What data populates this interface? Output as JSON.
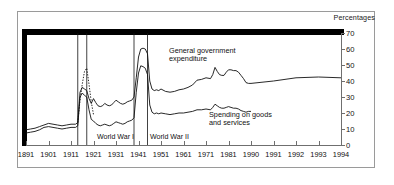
{
  "chart_data": {
    "type": "line",
    "title": "",
    "subtitle": "",
    "xlabel": "",
    "ylabel": "Percentages",
    "ylim": [
      0,
      70
    ],
    "ytick_labels": [
      "0",
      "10",
      "20",
      "30",
      "40",
      "50",
      "60",
      "70"
    ],
    "ytick_values": [
      0,
      10,
      20,
      30,
      40,
      50,
      60,
      70
    ],
    "xtick_labels": [
      "1891",
      "1901",
      "1911",
      "1921",
      "1931",
      "1941",
      "1951",
      "1961",
      "1971",
      "1981",
      "1990",
      "1991",
      "1992",
      "1993",
      "1994"
    ],
    "grid": false,
    "legend_position": "inline-annotations",
    "annotations": [
      {
        "name": "general-government-expenditure-label",
        "text_line1": "General government",
        "text_line2": "expenditure"
      },
      {
        "name": "spending-on-goods-and-services-label",
        "text_line1": "Spending on goods",
        "text_line2": "and services"
      },
      {
        "name": "world-war-1-label",
        "text": "World War I"
      },
      {
        "name": "world-war-2-label",
        "text": "World War II"
      }
    ],
    "event_markers": [
      {
        "label": "World War I",
        "start_year": 1914,
        "end_year": 1918
      },
      {
        "label": "World War II",
        "start_year": 1939,
        "end_year": 1945
      }
    ],
    "series": [
      {
        "name": "General government expenditure",
        "style": "solid",
        "x": [
          1891,
          1893,
          1895,
          1897,
          1899,
          1901,
          1903,
          1905,
          1907,
          1909,
          1911,
          1913,
          1914,
          1915,
          1916,
          1917,
          1918,
          1919,
          1920,
          1921,
          1922,
          1923,
          1924,
          1925,
          1926,
          1927,
          1928,
          1929,
          1930,
          1931,
          1932,
          1933,
          1934,
          1935,
          1936,
          1937,
          1938,
          1939,
          1940,
          1941,
          1942,
          1943,
          1944,
          1945,
          1946,
          1947,
          1948,
          1949,
          1950,
          1951,
          1953,
          1955,
          1957,
          1959,
          1961,
          1963,
          1965,
          1967,
          1969,
          1971,
          1973,
          1974,
          1975,
          1976,
          1977,
          1978,
          1979,
          1980,
          1981,
          1982,
          1983,
          1984,
          1985,
          1986,
          1987,
          1988,
          1989,
          1990,
          1991,
          1992,
          1993,
          1994
        ],
        "values": [
          9.5,
          10.0,
          10.5,
          11.5,
          12.5,
          13.5,
          13.0,
          12.5,
          12.0,
          12.5,
          13.0,
          13.0,
          14.0,
          33.0,
          36.0,
          35.0,
          34.0,
          29.0,
          26.0,
          29.0,
          26.5,
          24.5,
          24.0,
          24.5,
          26.0,
          25.0,
          24.5,
          25.0,
          26.5,
          28.0,
          27.0,
          26.0,
          25.5,
          26.0,
          27.0,
          27.5,
          28.0,
          30.0,
          42.0,
          55.0,
          60.0,
          60.5,
          60.0,
          57.0,
          40.0,
          35.0,
          34.0,
          34.5,
          34.0,
          35.0,
          33.5,
          33.0,
          33.5,
          34.5,
          35.0,
          36.0,
          37.5,
          40.5,
          41.0,
          42.0,
          41.5,
          44.0,
          48.5,
          46.0,
          44.0,
          43.5,
          43.5,
          45.5,
          47.0,
          47.0,
          46.5,
          46.5,
          45.5,
          43.5,
          41.5,
          39.0,
          38.5,
          38.5,
          40.0,
          42.0,
          42.5,
          42.0
        ]
      },
      {
        "name": "General government expenditure (dotted, war-years estimate)",
        "style": "dotted",
        "x": [
          1914,
          1915,
          1916,
          1917,
          1918,
          1919,
          1920,
          1921
        ],
        "values": [
          14.0,
          28.0,
          38.0,
          46.0,
          48.0,
          38.0,
          27.0,
          19.0
        ]
      },
      {
        "name": "Spending on goods and services",
        "style": "solid",
        "x": [
          1891,
          1893,
          1895,
          1897,
          1899,
          1901,
          1903,
          1905,
          1907,
          1909,
          1911,
          1913,
          1914,
          1915,
          1916,
          1917,
          1918,
          1919,
          1920,
          1921,
          1922,
          1923,
          1924,
          1925,
          1926,
          1927,
          1928,
          1929,
          1930,
          1931,
          1932,
          1933,
          1934,
          1935,
          1936,
          1937,
          1938,
          1939,
          1940,
          1941,
          1942,
          1943,
          1944,
          1945,
          1946,
          1947,
          1948,
          1949,
          1950,
          1951,
          1953,
          1955,
          1957,
          1959,
          1961,
          1963,
          1965,
          1967,
          1969,
          1971,
          1973,
          1974,
          1975,
          1976,
          1977,
          1978,
          1979,
          1980,
          1981,
          1982,
          1983,
          1984,
          1985,
          1986,
          1987,
          1988,
          1989,
          1990
        ],
        "values": [
          7.5,
          8.0,
          8.5,
          9.5,
          11.0,
          11.5,
          11.0,
          10.5,
          10.0,
          10.5,
          11.0,
          11.0,
          12.0,
          30.0,
          32.5,
          31.0,
          30.0,
          22.0,
          16.0,
          15.0,
          13.5,
          12.5,
          12.0,
          12.5,
          13.0,
          12.5,
          12.0,
          12.5,
          13.5,
          14.5,
          14.0,
          13.5,
          13.0,
          13.5,
          14.5,
          15.0,
          15.5,
          17.0,
          33.0,
          45.0,
          49.5,
          49.0,
          48.0,
          44.0,
          25.0,
          20.5,
          19.5,
          20.0,
          19.5,
          20.0,
          19.5,
          19.0,
          19.5,
          20.0,
          20.0,
          20.5,
          21.0,
          22.0,
          22.0,
          22.5,
          22.0,
          23.5,
          25.5,
          24.5,
          23.5,
          23.0,
          23.0,
          23.5,
          24.0,
          23.5,
          23.0,
          23.0,
          22.5,
          21.5,
          21.0,
          20.5,
          21.0,
          21.0
        ]
      }
    ]
  },
  "axes": {
    "y_caption": "Percentages"
  }
}
